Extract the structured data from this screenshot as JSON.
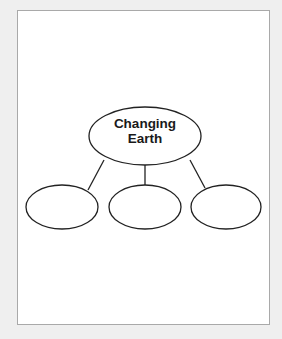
{
  "diagram": {
    "type": "concept-web",
    "center": {
      "label_line1": "Changing",
      "label_line2": "Earth"
    },
    "branches": [
      {
        "label": ""
      },
      {
        "label": ""
      },
      {
        "label": ""
      }
    ],
    "colors": {
      "stroke": "#222222",
      "page": "#ffffff",
      "border": "#a9a9a9",
      "background": "#efefef"
    }
  }
}
